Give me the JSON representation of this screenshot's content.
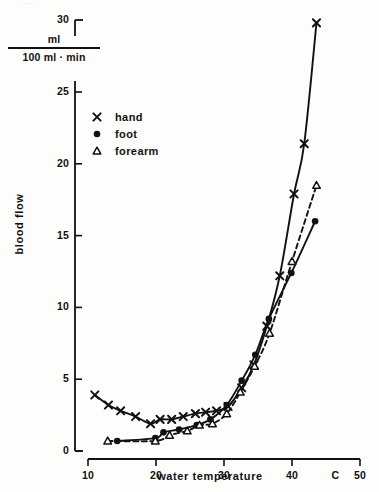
{
  "figure": {
    "top_artifact_text": "·····",
    "y_axis": {
      "title": "blood  flow",
      "unit_numerator": "ml",
      "unit_denominator": "100  ml · min",
      "ticks": [
        {
          "label": "0",
          "value": 0
        },
        {
          "label": "5",
          "value": 5
        },
        {
          "label": "10",
          "value": 10
        },
        {
          "label": "15",
          "value": 15
        },
        {
          "label": "20",
          "value": 20
        },
        {
          "label": "25",
          "value": 25
        },
        {
          "label": "30",
          "value": 30
        }
      ]
    },
    "x_axis": {
      "title": "water  temperature",
      "unit_symbol": "C",
      "ticks": [
        {
          "label": "10",
          "value": 10
        },
        {
          "label": "20",
          "value": 20
        },
        {
          "label": "30",
          "value": 30
        },
        {
          "label": "40",
          "value": 40
        },
        {
          "label": "50",
          "value": 50
        }
      ]
    },
    "legend": [
      {
        "marker": "cross-marker-icon",
        "label": "hand"
      },
      {
        "marker": "filled-circle-marker-icon",
        "label": "foot"
      },
      {
        "marker": "open-triangle-marker-icon",
        "label": "forearm"
      }
    ],
    "colors": {
      "ink": "#111111",
      "background": "#fdfdfc"
    }
  },
  "chart_data": {
    "type": "scatter",
    "title": "",
    "subtitle": "",
    "xlabel": "water temperature",
    "ylabel": "blood flow",
    "yunit": "ml / 100 ml · min",
    "xunit": "C",
    "xlim": [
      10,
      50
    ],
    "ylim": [
      0,
      30
    ],
    "xticks": [
      10,
      20,
      30,
      40,
      50
    ],
    "yticks": [
      0,
      5,
      10,
      15,
      20,
      25,
      30
    ],
    "y_axis_break_between": [
      25,
      30
    ],
    "grid": false,
    "legend_position": "upper-left",
    "series": [
      {
        "name": "hand",
        "marker": "x",
        "line": "solid",
        "points": [
          {
            "x": 11.0,
            "y": 3.9
          },
          {
            "x": 13.0,
            "y": 3.2
          },
          {
            "x": 14.8,
            "y": 2.8
          },
          {
            "x": 17.0,
            "y": 2.4
          },
          {
            "x": 19.2,
            "y": 1.9
          },
          {
            "x": 20.6,
            "y": 2.2
          },
          {
            "x": 22.3,
            "y": 2.2
          },
          {
            "x": 24.0,
            "y": 2.4
          },
          {
            "x": 25.8,
            "y": 2.6
          },
          {
            "x": 27.3,
            "y": 2.7
          },
          {
            "x": 28.9,
            "y": 2.8
          },
          {
            "x": 30.6,
            "y": 3.1
          },
          {
            "x": 32.6,
            "y": 4.4
          },
          {
            "x": 34.4,
            "y": 6.0
          },
          {
            "x": 36.3,
            "y": 8.7
          },
          {
            "x": 38.2,
            "y": 12.2
          },
          {
            "x": 40.3,
            "y": 17.9
          },
          {
            "x": 41.8,
            "y": 21.4
          },
          {
            "x": 43.6,
            "y": 29.8
          }
        ]
      },
      {
        "name": "foot",
        "marker": "o",
        "line": "solid",
        "points": [
          {
            "x": 14.3,
            "y": 0.7
          },
          {
            "x": 19.9,
            "y": 0.9
          },
          {
            "x": 21.1,
            "y": 1.3
          },
          {
            "x": 23.4,
            "y": 1.5
          },
          {
            "x": 26.0,
            "y": 1.8
          },
          {
            "x": 28.0,
            "y": 2.2
          },
          {
            "x": 30.4,
            "y": 3.2
          },
          {
            "x": 32.6,
            "y": 4.9
          },
          {
            "x": 34.6,
            "y": 6.7
          },
          {
            "x": 36.6,
            "y": 9.2
          },
          {
            "x": 39.9,
            "y": 12.4
          },
          {
            "x": 43.4,
            "y": 16.0
          }
        ]
      },
      {
        "name": "forearm",
        "marker": "^",
        "line": "dashed",
        "points": [
          {
            "x": 12.9,
            "y": 0.7
          },
          {
            "x": 19.9,
            "y": 0.7
          },
          {
            "x": 22.0,
            "y": 1.1
          },
          {
            "x": 24.6,
            "y": 1.4
          },
          {
            "x": 26.4,
            "y": 1.8
          },
          {
            "x": 28.3,
            "y": 1.9
          },
          {
            "x": 30.4,
            "y": 2.6
          },
          {
            "x": 32.4,
            "y": 4.1
          },
          {
            "x": 34.5,
            "y": 5.9
          },
          {
            "x": 36.7,
            "y": 8.2
          },
          {
            "x": 40.0,
            "y": 13.2
          },
          {
            "x": 43.6,
            "y": 18.5
          }
        ]
      }
    ]
  }
}
